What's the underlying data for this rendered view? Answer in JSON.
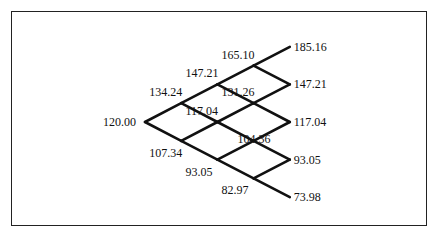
{
  "diagram": {
    "type": "binomial-tree",
    "steps": 4,
    "line_color": "#111111",
    "nodes": [
      {
        "id": "n0_0",
        "level": 0,
        "j": 0,
        "value": "120.00",
        "label_pos": "left"
      },
      {
        "id": "n1_1",
        "level": 1,
        "j": 1,
        "value": "134.24",
        "label_pos": "above-left"
      },
      {
        "id": "n1_0",
        "level": 1,
        "j": 0,
        "value": "107.34",
        "label_pos": "below-left"
      },
      {
        "id": "n2_2",
        "level": 2,
        "j": 2,
        "value": "147.21",
        "label_pos": "above-left"
      },
      {
        "id": "n2_1",
        "level": 2,
        "j": 1,
        "value": "117.04",
        "label_pos": "above-left"
      },
      {
        "id": "n2_0",
        "level": 2,
        "j": 0,
        "value": "93.05",
        "label_pos": "below-left"
      },
      {
        "id": "n3_3",
        "level": 3,
        "j": 3,
        "value": "165.10",
        "label_pos": "above-left"
      },
      {
        "id": "n3_2",
        "level": 3,
        "j": 2,
        "value": "131.26",
        "label_pos": "above-left"
      },
      {
        "id": "n3_1",
        "level": 3,
        "j": 1,
        "value": "104.36",
        "label_pos": "below-right"
      },
      {
        "id": "n3_0",
        "level": 3,
        "j": 0,
        "value": "82.97",
        "label_pos": "below-left"
      },
      {
        "id": "n4_4",
        "level": 4,
        "j": 4,
        "value": "185.16",
        "label_pos": "right"
      },
      {
        "id": "n4_3",
        "level": 4,
        "j": 3,
        "value": "147.21",
        "label_pos": "right"
      },
      {
        "id": "n4_2",
        "level": 4,
        "j": 2,
        "value": "117.04",
        "label_pos": "right"
      },
      {
        "id": "n4_1",
        "level": 4,
        "j": 1,
        "value": "93.05",
        "label_pos": "right"
      },
      {
        "id": "n4_0",
        "level": 4,
        "j": 0,
        "value": "73.98",
        "label_pos": "right"
      }
    ]
  }
}
